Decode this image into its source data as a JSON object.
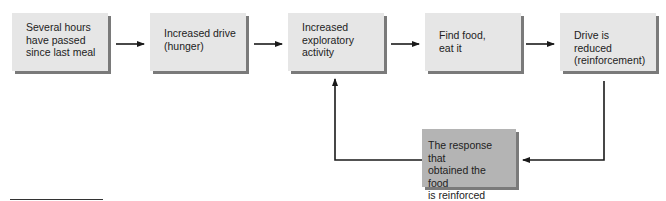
{
  "diagram": {
    "type": "flowchart",
    "boxes": [
      {
        "id": "b1",
        "label": "Several hours\nhave passed\nsince last meal"
      },
      {
        "id": "b2",
        "label": "Increased drive\n(hunger)"
      },
      {
        "id": "b3",
        "label": "Increased\nexploratory\nactivity"
      },
      {
        "id": "b4",
        "label": "Find food,\neat it"
      },
      {
        "id": "b5",
        "label": "Drive is reduced\n(reinforcement)"
      },
      {
        "id": "b6",
        "label": "The response that\nobtained the food\nis reinforced"
      }
    ],
    "edges": [
      {
        "from": "b1",
        "to": "b2"
      },
      {
        "from": "b2",
        "to": "b3"
      },
      {
        "from": "b3",
        "to": "b4"
      },
      {
        "from": "b4",
        "to": "b5"
      },
      {
        "from": "b5",
        "to": "b6"
      },
      {
        "from": "b6",
        "to": "b3"
      }
    ],
    "colors": {
      "box_fill": "#e6e6e6",
      "highlight_box_fill": "#b4b4b4",
      "shadow": "#7a7a7a",
      "line": "#1a1a1a"
    }
  }
}
